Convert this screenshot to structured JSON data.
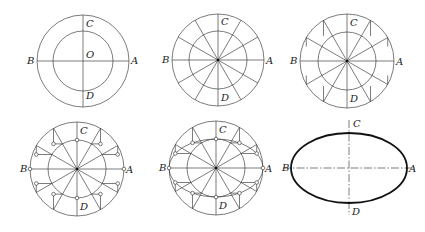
{
  "figure": {
    "step_count": 6,
    "point_labels": {
      "A": "A",
      "B": "B",
      "C": "C",
      "D": "D",
      "O": "O"
    },
    "stroke_color": "#444444",
    "ellipse_color": "#111111",
    "panels": [
      {
        "id": "step-1",
        "description": "Two concentric circles with diameters AB and CD, center O",
        "cx": 83,
        "cy": 61,
        "R": 46,
        "r": 30,
        "labels": [
          "C",
          "B",
          "O",
          "A",
          "D"
        ]
      },
      {
        "id": "step-2",
        "description": "Divide circles into 12 equal parts with radial lines",
        "cx": 218,
        "cy": 60,
        "R": 46,
        "r": 29,
        "labels": [
          "C",
          "B",
          "A",
          "D"
        ]
      },
      {
        "id": "step-3",
        "description": "Draw vertical lines from outer circle intersection points",
        "cx": 347,
        "cy": 61,
        "R": 47,
        "r": 29,
        "labels": [
          "C",
          "B",
          "A",
          "D"
        ]
      },
      {
        "id": "step-4",
        "description": "Draw horizontal lines from inner circle points; mark intersections",
        "cx": 77,
        "cy": 169,
        "R": 47,
        "r": 29,
        "labels": [
          "C",
          "B",
          "A",
          "D"
        ]
      },
      {
        "id": "step-5",
        "description": "Connect intersection points with a smooth curve",
        "cx": 216,
        "cy": 168,
        "R": 47,
        "r": 29,
        "labels": [
          "C",
          "B",
          "A",
          "D"
        ]
      },
      {
        "id": "step-6",
        "description": "Finished ellipse with major axis AB and minor axis CD",
        "cx": 349,
        "cy": 168,
        "a": 58,
        "b": 35,
        "labels": [
          "C",
          "B",
          "A",
          "D"
        ]
      }
    ]
  }
}
